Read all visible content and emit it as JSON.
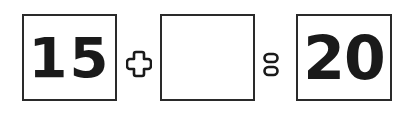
{
  "equation": {
    "left_operand": "15",
    "operator": "+",
    "right_operand": "",
    "equals": "=",
    "result": "20"
  },
  "icons": {
    "plus": "plus-icon",
    "equals": "equals-icon"
  },
  "colors": {
    "stroke": "#2a2a2a",
    "text": "#1a1a1a",
    "background": "#ffffff"
  }
}
